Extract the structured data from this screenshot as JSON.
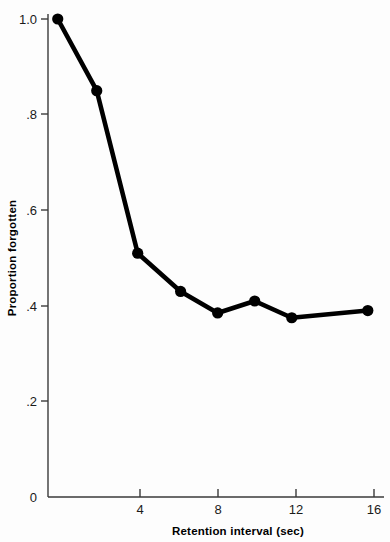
{
  "chart_data": {
    "type": "line",
    "title": "",
    "xlabel": "Retention interval (sec)",
    "ylabel": "Proportion forgotten",
    "xlim": [
      0,
      17.5
    ],
    "ylim": [
      0,
      1.0
    ],
    "grid": false,
    "legend": null,
    "x_ticks": [
      4,
      8,
      12,
      16
    ],
    "x_tick_labels": [
      "4",
      "8",
      "12",
      "16"
    ],
    "y_ticks": [
      0,
      0.2,
      0.4,
      0.6,
      0.8,
      1.0
    ],
    "y_tick_labels": [
      "0",
      ".2",
      ".4",
      ".6",
      ".8",
      "1.0"
    ],
    "series": [
      {
        "name": "Proportion forgotten",
        "color": "#000000",
        "marker": "circle",
        "x": [
          0.5,
          2.5,
          4.6,
          6.8,
          8.7,
          10.6,
          12.5,
          16.4
        ],
        "values": [
          1.0,
          0.85,
          0.51,
          0.43,
          0.385,
          0.41,
          0.375,
          0.39
        ]
      }
    ]
  },
  "axes": {
    "x_title": "Retention interval (sec)",
    "y_title": "Proportion forgotten"
  }
}
